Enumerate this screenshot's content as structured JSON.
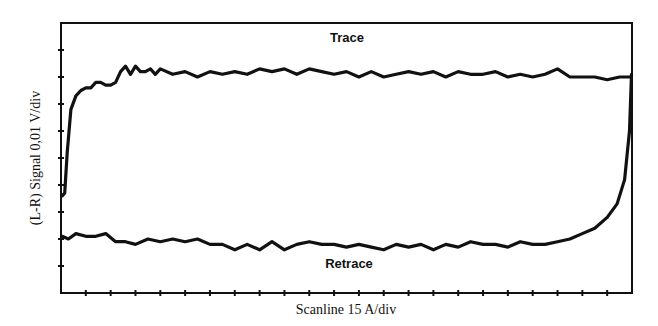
{
  "chart_data": {
    "type": "line",
    "title": "",
    "xlabel": "Scanline 15 A/div",
    "ylabel": "(L-R) Signal 0,01 V/div",
    "x_divisions": 23,
    "y_divisions": 10,
    "xlim": [
      0,
      23
    ],
    "ylim": [
      0,
      10
    ],
    "grid": false,
    "legend": null,
    "annotations": [
      "Trace",
      "Retrace"
    ],
    "series": [
      {
        "name": "Trace",
        "x": [
          0.05,
          0.15,
          0.25,
          0.4,
          0.6,
          0.8,
          1.0,
          1.2,
          1.4,
          1.6,
          1.8,
          2.0,
          2.2,
          2.4,
          2.6,
          2.8,
          3.0,
          3.2,
          3.4,
          3.6,
          3.8,
          4.0,
          4.5,
          5.0,
          5.5,
          6.0,
          6.5,
          7.0,
          7.5,
          8.0,
          8.5,
          9.0,
          9.5,
          10.0,
          10.5,
          11.0,
          11.5,
          12.0,
          12.5,
          13.0,
          13.5,
          14.0,
          14.5,
          15.0,
          15.5,
          16.0,
          16.5,
          17.0,
          17.5,
          18.0,
          18.5,
          19.0,
          19.5,
          20.0,
          20.5,
          21.0,
          21.5,
          22.0,
          22.5,
          22.8,
          22.95
        ],
        "y": [
          3.6,
          3.7,
          5.2,
          6.8,
          7.3,
          7.5,
          7.6,
          7.6,
          7.8,
          7.8,
          7.7,
          7.7,
          7.8,
          8.2,
          8.4,
          8.1,
          8.4,
          8.2,
          8.2,
          8.3,
          8.1,
          8.3,
          8.1,
          8.2,
          8.0,
          8.2,
          8.1,
          8.2,
          8.1,
          8.3,
          8.2,
          8.3,
          8.1,
          8.3,
          8.2,
          8.1,
          8.2,
          8.0,
          8.2,
          8.0,
          8.1,
          8.2,
          8.1,
          8.2,
          8.0,
          8.2,
          8.1,
          8.1,
          8.2,
          8.0,
          8.1,
          8.0,
          8.1,
          8.3,
          8.0,
          8.0,
          8.0,
          7.9,
          8.0,
          8.0,
          8.0
        ]
      },
      {
        "name": "Retrace",
        "x": [
          0.05,
          0.3,
          0.6,
          1.0,
          1.4,
          1.8,
          2.2,
          2.6,
          3.0,
          3.5,
          4.0,
          4.5,
          5.0,
          5.5,
          6.0,
          6.5,
          7.0,
          7.5,
          8.0,
          8.5,
          9.0,
          9.5,
          10.0,
          10.5,
          11.0,
          11.5,
          12.0,
          12.5,
          13.0,
          13.5,
          14.0,
          14.5,
          15.0,
          15.5,
          16.0,
          16.5,
          17.0,
          17.5,
          18.0,
          18.5,
          19.0,
          19.5,
          20.0,
          20.5,
          21.0,
          21.5,
          22.0,
          22.4,
          22.7,
          22.9,
          22.98
        ],
        "y": [
          2.1,
          2.0,
          2.2,
          2.1,
          2.1,
          2.2,
          1.9,
          1.9,
          1.8,
          2.0,
          1.9,
          2.0,
          1.9,
          2.0,
          1.8,
          1.8,
          1.6,
          1.8,
          1.6,
          1.9,
          1.6,
          1.8,
          1.9,
          1.8,
          1.8,
          1.7,
          1.8,
          1.7,
          1.6,
          1.8,
          1.7,
          1.8,
          1.6,
          1.8,
          1.7,
          1.9,
          1.8,
          1.8,
          1.7,
          1.9,
          1.8,
          1.8,
          1.9,
          2.0,
          2.2,
          2.4,
          2.8,
          3.3,
          4.2,
          6.0,
          8.1
        ]
      }
    ]
  },
  "labels": {
    "ylabel": "(L-R) Signal 0,01 V/div",
    "xlabel": "Scanline 15 A/div",
    "trace": "Trace",
    "retrace": "Retrace"
  },
  "style": {
    "line_color": "#111111",
    "axis_color": "#111111",
    "background": "#ffffff"
  }
}
